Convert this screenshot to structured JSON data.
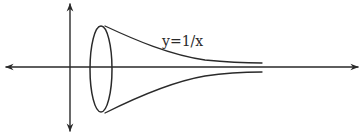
{
  "diagram": {
    "type": "surface-of-revolution sketch",
    "curve_label": "y=1/x",
    "colors": {
      "background": "#ffffff",
      "ink": "#2a2a2a"
    },
    "elements": {
      "x_axis": {
        "from": [
          6,
          67
        ],
        "to": [
          358,
          67
        ],
        "arrows": "both"
      },
      "y_axis": {
        "from": [
          70,
          4
        ],
        "to": [
          70,
          131
        ],
        "arrows": "both"
      },
      "cross_section_ellipse": {
        "cx": 101,
        "cy": 69,
        "rx": 11,
        "ry": 43
      },
      "upper_curve": {
        "start": [
          105,
          26
        ],
        "end": [
          262,
          63
        ]
      },
      "lower_curve": {
        "start": [
          105,
          113
        ],
        "end": [
          262,
          72
        ]
      }
    }
  }
}
